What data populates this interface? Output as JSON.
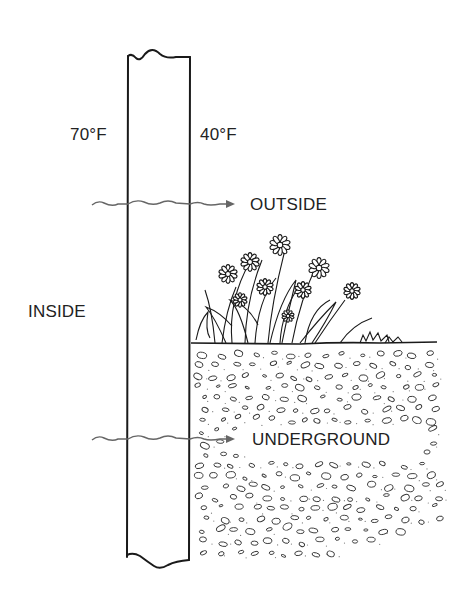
{
  "diagram": {
    "labels": {
      "inside_temp": "70°F",
      "outside_temp": "40°F",
      "outside": "OUTSIDE",
      "inside": "INSIDE",
      "underground": "UNDERGROUND"
    },
    "arrows": [
      {
        "name": "heat-flow-outside",
        "from": "INSIDE",
        "to": "OUTSIDE",
        "style": "wavy"
      },
      {
        "name": "heat-flow-underground",
        "from": "INSIDE",
        "to": "UNDERGROUND",
        "style": "wavy"
      }
    ],
    "elements": [
      "wall-section",
      "flower-bed",
      "ground-line",
      "soil-pebbles"
    ],
    "colors": {
      "ink": "#1a1a1a",
      "arrow": "#555555",
      "text": "#222222",
      "background": "#ffffff"
    }
  }
}
